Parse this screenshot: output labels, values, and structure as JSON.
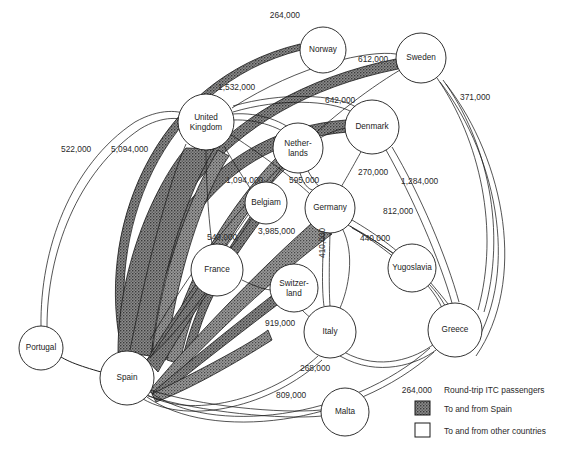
{
  "figure": {
    "type": "flow-network-map",
    "background": "#ffffff"
  },
  "nodes": [
    {
      "id": "norway",
      "label": "Norway",
      "x": 323,
      "y": 50,
      "r": 23
    },
    {
      "id": "sweden",
      "label": "Sweden",
      "x": 421,
      "y": 58,
      "r": 25
    },
    {
      "id": "united_kingdom",
      "label": "United",
      "label2": "Kingdom",
      "x": 206,
      "y": 122,
      "r": 28
    },
    {
      "id": "denmark",
      "label": "Denmark",
      "x": 372,
      "y": 127,
      "r": 27
    },
    {
      "id": "netherlands",
      "label": "Nether-",
      "label2": "lands",
      "x": 298,
      "y": 148,
      "r": 25
    },
    {
      "id": "belgium",
      "label": "Belgiam",
      "x": 266,
      "y": 203,
      "r": 21
    },
    {
      "id": "germany",
      "label": "Germany",
      "x": 330,
      "y": 208,
      "r": 25
    },
    {
      "id": "france",
      "label": "France",
      "x": 217,
      "y": 270,
      "r": 26
    },
    {
      "id": "switzerland",
      "label": "Switzer-",
      "label2": "land",
      "x": 294,
      "y": 288,
      "r": 24
    },
    {
      "id": "yugoslavia",
      "label": "Yugoslavia",
      "x": 412,
      "y": 268,
      "r": 24
    },
    {
      "id": "italy",
      "label": "Italy",
      "x": 330,
      "y": 332,
      "r": 26
    },
    {
      "id": "greece",
      "label": "Greece",
      "x": 455,
      "y": 330,
      "r": 27
    },
    {
      "id": "portugal",
      "label": "Portugal",
      "x": 41,
      "y": 348,
      "r": 22
    },
    {
      "id": "spain",
      "label": "Spain",
      "x": 127,
      "y": 378,
      "r": 27
    },
    {
      "id": "malta",
      "label": "Malta",
      "x": 345,
      "y": 412,
      "r": 24
    }
  ],
  "edge_labels": [
    {
      "id": "spain_norway",
      "value": "264,000",
      "x": 300,
      "y": 18,
      "anchor": "end"
    },
    {
      "id": "spain_sweden",
      "value": "612,000",
      "x": 358,
      "y": 62,
      "anchor": "start"
    },
    {
      "id": "spain_denmark",
      "value": "642,000",
      "x": 325,
      "y": 103,
      "anchor": "start"
    },
    {
      "id": "uk_elsewhere",
      "value": "1,532,000",
      "x": 218,
      "y": 90,
      "anchor": "start"
    },
    {
      "id": "sweden_greece",
      "value": "371,000",
      "x": 460,
      "y": 100,
      "anchor": "start"
    },
    {
      "id": "portugal_uk",
      "value": "522,000",
      "x": 61,
      "y": 152,
      "anchor": "start"
    },
    {
      "id": "spain_uk",
      "value": "5,094,000",
      "x": 111,
      "y": 152,
      "anchor": "start"
    },
    {
      "id": "netherlands_germany",
      "value": "270,000",
      "x": 358,
      "y": 175,
      "anchor": "start"
    },
    {
      "id": "uk_netherlands",
      "value": "1,094,000",
      "x": 226,
      "y": 183,
      "anchor": "start"
    },
    {
      "id": "netherlands_spain",
      "value": "595,000",
      "x": 289,
      "y": 183,
      "anchor": "start"
    },
    {
      "id": "denmark_greece",
      "value": "1,284,000",
      "x": 401,
      "y": 184,
      "anchor": "start"
    },
    {
      "id": "germany_yugoslavia",
      "value": "812,000",
      "x": 383,
      "y": 214,
      "anchor": "start"
    },
    {
      "id": "germany_italy_alt",
      "value": "440,000",
      "x": 360,
      "y": 241,
      "anchor": "start"
    },
    {
      "id": "belgium_france",
      "value": "540,000",
      "x": 207,
      "y": 240,
      "anchor": "start"
    },
    {
      "id": "germany_spain",
      "value": "3,985,000",
      "x": 258,
      "y": 234,
      "anchor": "start"
    },
    {
      "id": "germany_italy",
      "value": "410,000",
      "x": 325,
      "y": 258,
      "anchor": "start",
      "rotate": -90
    },
    {
      "id": "switzerland_spain",
      "value": "919,000",
      "x": 265,
      "y": 326,
      "anchor": "start"
    },
    {
      "id": "italy_greece",
      "value": "268,000",
      "x": 300,
      "y": 371,
      "anchor": "start"
    },
    {
      "id": "spain_malta",
      "value": "809,000",
      "x": 276,
      "y": 398,
      "anchor": "start"
    }
  ],
  "legend": {
    "sample_value": "264,000",
    "sample_caption": "Round-trip ITC passengers",
    "items": [
      {
        "id": "spain-swatch",
        "swatch": "hatched",
        "color": "#6e6e6e",
        "label": "To and from Spain"
      },
      {
        "id": "other-swatch",
        "swatch": "open",
        "color": "#ffffff",
        "label": "To and from other countries"
      }
    ]
  },
  "colors": {
    "stroke": "#1b1b1b",
    "spain_fill": "#6e6e6e",
    "other_fill": "#ffffff",
    "text": "#2a2a2a"
  }
}
